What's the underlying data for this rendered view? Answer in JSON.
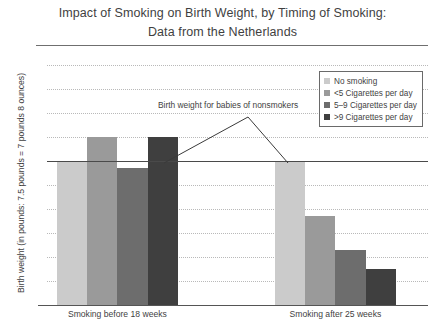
{
  "chart_data": {
    "type": "bar",
    "title": "Impact of Smoking on Birth Weight, by Timing of Smoking:",
    "subtitle": "Data from the Netherlands",
    "xlabel": "",
    "ylabel": "Birth weight (in pounds: 7.5 pounds = 7 pounds 8 ounces)",
    "categories": [
      "Smoking before 18 weeks",
      "Smoking after 25 weeks"
    ],
    "series": [
      {
        "name": "No smoking",
        "color": "#cbcbcb",
        "values": [
          7.6,
          7.6
        ]
      },
      {
        "name": "<5 Cigarettes per day",
        "color": "#9a9a9a",
        "values": [
          7.7,
          7.37
        ]
      },
      {
        "name": "5–9 Cigarettes per day",
        "color": "#6d6d6d",
        "values": [
          7.57,
          7.23
        ]
      },
      {
        "name": ">9 Cigarettes per day",
        "color": "#3f3f3f",
        "values": [
          7.7,
          7.15
        ]
      }
    ],
    "ylim": [
      7,
      8
    ],
    "ytick_labels": [
      "8",
      "7.9",
      "7.8",
      "7.7",
      "7.6",
      "7.5",
      "7.4",
      "7.3",
      "7.2",
      "7.1",
      "7"
    ],
    "ytick_values": [
      8,
      7.9,
      7.8,
      7.7,
      7.6,
      7.5,
      7.4,
      7.3,
      7.2,
      7.1,
      7
    ],
    "grid": true,
    "legend_position": "top-right",
    "annotations": [
      {
        "text": "Birth weight for babies of nonsmokers",
        "reference_value": 7.6
      }
    ]
  }
}
